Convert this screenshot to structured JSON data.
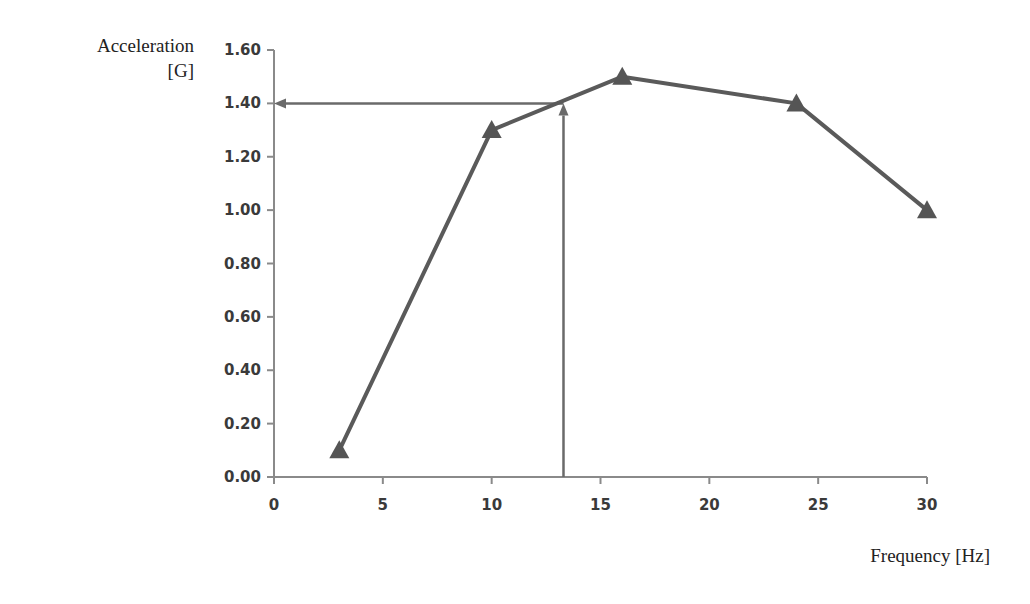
{
  "chart_data": {
    "type": "line",
    "title": "",
    "xlabel": "Frequency [Hz]",
    "ylabel_line1": "Acceleration",
    "ylabel_line2": "[G]",
    "xlim": [
      0,
      30
    ],
    "ylim": [
      0,
      1.6
    ],
    "x_ticks": [
      0,
      5,
      10,
      15,
      20,
      25,
      30
    ],
    "x_tick_labels": [
      "0",
      "5",
      "10",
      "15",
      "20",
      "25",
      "30"
    ],
    "y_ticks": [
      0,
      0.2,
      0.4,
      0.6,
      0.8,
      1.0,
      1.2,
      1.4,
      1.6
    ],
    "y_tick_labels": [
      "0.00",
      "0.20",
      "0.40",
      "0.60",
      "0.80",
      "1.00",
      "1.20",
      "1.40",
      "1.60"
    ],
    "grid": false,
    "legend": null,
    "marker": "triangle",
    "series": [
      {
        "name": "Acceleration",
        "x": [
          3,
          10,
          16,
          24,
          30
        ],
        "y": [
          0.1,
          1.3,
          1.5,
          1.4,
          1.0
        ],
        "color": "#555555"
      }
    ],
    "annotations": [
      {
        "type": "arrow",
        "description": "vertical arrow from x-axis up to curve",
        "from": [
          13.3,
          0.0
        ],
        "to": [
          13.3,
          1.4
        ],
        "color": "#6a6a6a"
      },
      {
        "type": "arrow",
        "description": "horizontal arrow from curve left to y-axis",
        "from": [
          13.3,
          1.4
        ],
        "to": [
          0.0,
          1.4
        ],
        "color": "#6a6a6a"
      }
    ]
  }
}
